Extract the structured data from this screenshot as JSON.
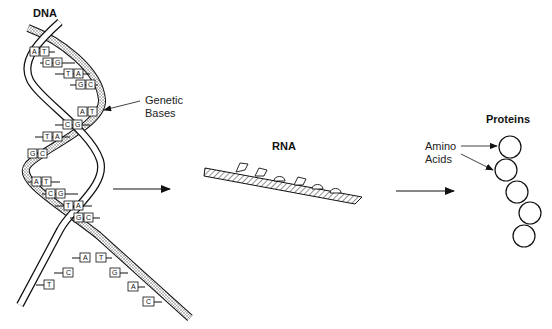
{
  "diagram": {
    "titles": {
      "dna": "DNA",
      "rna": "RNA",
      "proteins": "Proteins"
    },
    "annotations": {
      "genetic_bases_line1": "Genetic",
      "genetic_bases_line2": "Bases",
      "amino_acids_line1": "Amino",
      "amino_acids_line2": "Acids"
    },
    "dna_base_pairs": [
      [
        "A",
        "T"
      ],
      [
        "C",
        "G"
      ],
      [
        "T",
        "A"
      ],
      [
        "G",
        "C"
      ],
      [
        "A",
        "T"
      ],
      [
        "C",
        "G"
      ],
      [
        "T",
        "A"
      ],
      [
        "G",
        "C"
      ],
      [
        "A",
        "T"
      ],
      [
        "C",
        "G"
      ],
      [
        "T",
        "A"
      ],
      [
        "G",
        "C"
      ]
    ],
    "unzipped_bases": {
      "left_strand": [
        "A",
        "C",
        "T"
      ],
      "right_strand": [
        "T",
        "G",
        "A",
        "C"
      ]
    },
    "flow": [
      "DNA",
      "RNA",
      "Proteins"
    ],
    "protein_amino_acid_count": 5,
    "colors": {
      "line": "#111111",
      "background": "#ffffff",
      "stipple": "#888888"
    }
  }
}
